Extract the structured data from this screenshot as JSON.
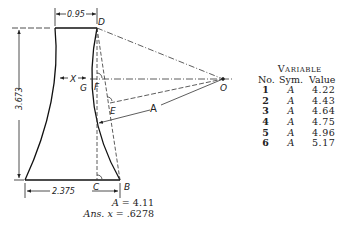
{
  "figure": {
    "points": {
      "D": "D",
      "G": "G",
      "F": "F",
      "E": "E",
      "O": "O",
      "C": "C",
      "B": "B"
    },
    "labels": {
      "x": "X",
      "A": "A"
    },
    "dimensions": {
      "top_width": "0.95",
      "height": "3.673",
      "bottom_width": "2.375"
    }
  },
  "variable_table": {
    "title": "Variable",
    "headers": {
      "no": "No.",
      "sym": "Sym.",
      "value": "Value"
    },
    "rows": [
      {
        "no": "1",
        "sym": "A",
        "value": "4.22"
      },
      {
        "no": "2",
        "sym": "A",
        "value": "4.43"
      },
      {
        "no": "3",
        "sym": "A",
        "value": "4.64"
      },
      {
        "no": "4",
        "sym": "A",
        "value": "4.75"
      },
      {
        "no": "5",
        "sym": "A",
        "value": "4.96"
      },
      {
        "no": "6",
        "sym": "A",
        "value": "5.17"
      }
    ]
  },
  "answer": {
    "given_label": "A",
    "given_eq": "= 4.11",
    "ans_label": "Ans. x",
    "ans_eq": "= .6278"
  }
}
